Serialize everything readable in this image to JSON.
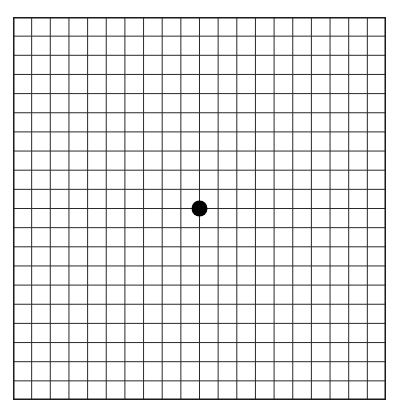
{
  "diagram": {
    "type": "amsler-grid",
    "rows": 20,
    "columns": 20,
    "line_color": "#2a2a2a",
    "border_color": "#1a1a1a",
    "background": "#ffffff",
    "fixation_dot": {
      "color": "#000000",
      "radius": 8,
      "position": "center"
    }
  }
}
